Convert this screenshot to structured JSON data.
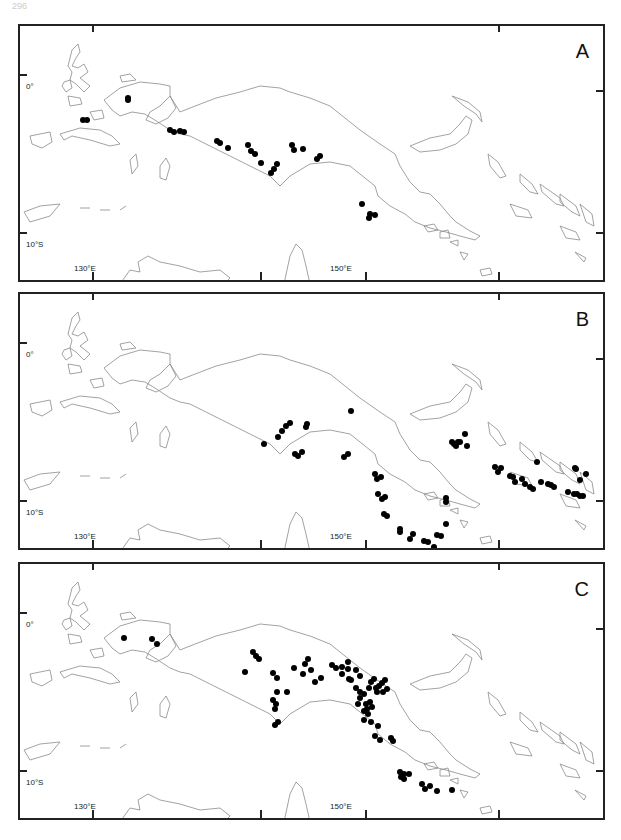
{
  "page": {
    "number": "296"
  },
  "axes": {
    "lat_labels": [
      "0°",
      "10°S"
    ],
    "lon_labels": [
      "130°E",
      "150°E"
    ]
  },
  "colors": {
    "coast": "#8a8a8a",
    "frame": "#222222",
    "point": "#000000"
  },
  "panels": [
    {
      "letter": "A",
      "points": [
        [
          108,
          72
        ],
        [
          108,
          74
        ],
        [
          63,
          94
        ],
        [
          67,
          94
        ],
        [
          150,
          104
        ],
        [
          154,
          106
        ],
        [
          160,
          105
        ],
        [
          164,
          106
        ],
        [
          197,
          115
        ],
        [
          200,
          117
        ],
        [
          208,
          122
        ],
        [
          228,
          119
        ],
        [
          231,
          125
        ],
        [
          235,
          128
        ],
        [
          241,
          137
        ],
        [
          251,
          147
        ],
        [
          254,
          143
        ],
        [
          257,
          138
        ],
        [
          272,
          119
        ],
        [
          274,
          124
        ],
        [
          283,
          123
        ],
        [
          297,
          133
        ],
        [
          300,
          130
        ],
        [
          342,
          178
        ],
        [
          350,
          188
        ],
        [
          349,
          192
        ],
        [
          355,
          189
        ]
      ]
    },
    {
      "letter": "B",
      "points": [
        [
          244,
          150
        ],
        [
          258,
          143
        ],
        [
          262,
          137
        ],
        [
          270,
          129
        ],
        [
          266,
          132
        ],
        [
          287,
          130
        ],
        [
          286,
          133
        ],
        [
          331,
          117
        ],
        [
          275,
          160
        ],
        [
          278,
          162
        ],
        [
          282,
          158
        ],
        [
          324,
          163
        ],
        [
          328,
          160
        ],
        [
          355,
          180
        ],
        [
          357,
          185
        ],
        [
          361,
          183
        ],
        [
          358,
          200
        ],
        [
          362,
          205
        ],
        [
          365,
          203
        ],
        [
          364,
          220
        ],
        [
          367,
          222
        ],
        [
          380,
          235
        ],
        [
          380,
          238
        ],
        [
          393,
          240
        ],
        [
          390,
          245
        ],
        [
          404,
          247
        ],
        [
          408,
          248
        ],
        [
          414,
          253
        ],
        [
          417,
          241
        ],
        [
          421,
          242
        ],
        [
          426,
          204
        ],
        [
          426,
          208
        ],
        [
          426,
          230
        ],
        [
          432,
          148
        ],
        [
          434,
          150
        ],
        [
          438,
          148
        ],
        [
          436,
          152
        ],
        [
          440,
          148
        ],
        [
          445,
          140
        ],
        [
          447,
          152
        ],
        [
          475,
          173
        ],
        [
          478,
          178
        ],
        [
          481,
          174
        ],
        [
          493,
          183
        ],
        [
          495,
          188
        ],
        [
          490,
          182
        ],
        [
          505,
          190
        ],
        [
          502,
          185
        ],
        [
          510,
          193
        ],
        [
          513,
          195
        ],
        [
          521,
          188
        ],
        [
          528,
          190
        ],
        [
          531,
          191
        ],
        [
          534,
          193
        ],
        [
          548,
          198
        ],
        [
          554,
          200
        ],
        [
          560,
          202
        ],
        [
          557,
          200
        ],
        [
          563,
          202
        ],
        [
          560,
          186
        ],
        [
          566,
          180
        ],
        [
          556,
          175
        ],
        [
          517,
          168
        ],
        [
          555,
          174
        ]
      ]
    },
    {
      "letter": "C",
      "points": [
        [
          104,
          74
        ],
        [
          132,
          75
        ],
        [
          137,
          80
        ],
        [
          233,
          88
        ],
        [
          236,
          92
        ],
        [
          239,
          95
        ],
        [
          225,
          108
        ],
        [
          253,
          109
        ],
        [
          257,
          114
        ],
        [
          257,
          128
        ],
        [
          253,
          136
        ],
        [
          256,
          140
        ],
        [
          255,
          145
        ],
        [
          258,
          158
        ],
        [
          255,
          161
        ],
        [
          267,
          128
        ],
        [
          274,
          104
        ],
        [
          283,
          110
        ],
        [
          285,
          100
        ],
        [
          288,
          95
        ],
        [
          291,
          106
        ],
        [
          295,
          118
        ],
        [
          301,
          114
        ],
        [
          312,
          101
        ],
        [
          316,
          104
        ],
        [
          322,
          103
        ],
        [
          328,
          98
        ],
        [
          322,
          110
        ],
        [
          329,
          115
        ],
        [
          336,
          106
        ],
        [
          340,
          112
        ],
        [
          328,
          105
        ],
        [
          331,
          116
        ],
        [
          336,
          124
        ],
        [
          340,
          128
        ],
        [
          344,
          130
        ],
        [
          340,
          134
        ],
        [
          338,
          140
        ],
        [
          346,
          140
        ],
        [
          350,
          138
        ],
        [
          347,
          145
        ],
        [
          344,
          147
        ],
        [
          352,
          143
        ],
        [
          354,
          115
        ],
        [
          351,
          118
        ],
        [
          349,
          124
        ],
        [
          356,
          124
        ],
        [
          359,
          122
        ],
        [
          365,
          116
        ],
        [
          362,
          119
        ],
        [
          357,
          128
        ],
        [
          363,
          128
        ],
        [
          367,
          125
        ],
        [
          348,
          150
        ],
        [
          344,
          156
        ],
        [
          351,
          158
        ],
        [
          358,
          162
        ],
        [
          355,
          172
        ],
        [
          360,
          176
        ],
        [
          371,
          174
        ],
        [
          373,
          177
        ],
        [
          380,
          208
        ],
        [
          384,
          210
        ],
        [
          381,
          213
        ],
        [
          384,
          215
        ],
        [
          389,
          210
        ],
        [
          402,
          220
        ],
        [
          405,
          225
        ],
        [
          410,
          222
        ],
        [
          417,
          227
        ],
        [
          443,
          262
        ],
        [
          447,
          264
        ],
        [
          452,
          262
        ],
        [
          458,
          266
        ],
        [
          466,
          266
        ],
        [
          470,
          266
        ],
        [
          467,
          262
        ],
        [
          432,
          226
        ]
      ]
    }
  ]
}
